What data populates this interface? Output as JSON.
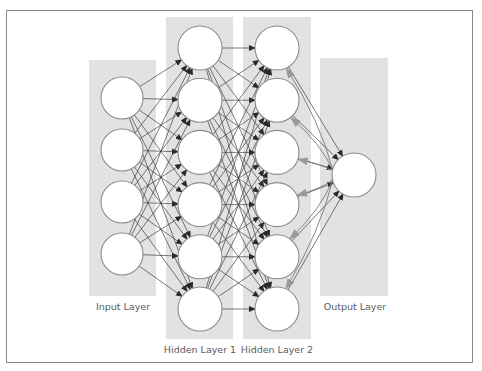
{
  "figure": {
    "colors": {
      "panel": "#e2e2e2",
      "node_fill": "#ffffff",
      "node_stroke": "#8c8c8c",
      "forward_edge": "#3f3f3f",
      "backward_edge": "#7a7a7a",
      "frame": "#8a8a8a",
      "label": "#5a5a5a"
    },
    "layers": [
      {
        "id": "input",
        "label": "Input Layer",
        "node_count": 4
      },
      {
        "id": "hidden1",
        "label": "Hidden Layer 1",
        "node_count": 6
      },
      {
        "id": "hidden2",
        "label": "Hidden Layer 2",
        "node_count": 6
      },
      {
        "id": "output",
        "label": "Output Layer",
        "node_count": 1
      }
    ],
    "connections": [
      {
        "from": "input",
        "to": "hidden1",
        "type": "fully-connected",
        "direction": "forward"
      },
      {
        "from": "hidden1",
        "to": "hidden2",
        "type": "fully-connected",
        "direction": "forward"
      },
      {
        "from": "hidden2",
        "to": "output",
        "type": "fully-connected",
        "direction": "forward"
      },
      {
        "from": "output",
        "to": "hidden2",
        "type": "fully-connected",
        "direction": "backward",
        "style": "curved gray arrows"
      }
    ]
  }
}
